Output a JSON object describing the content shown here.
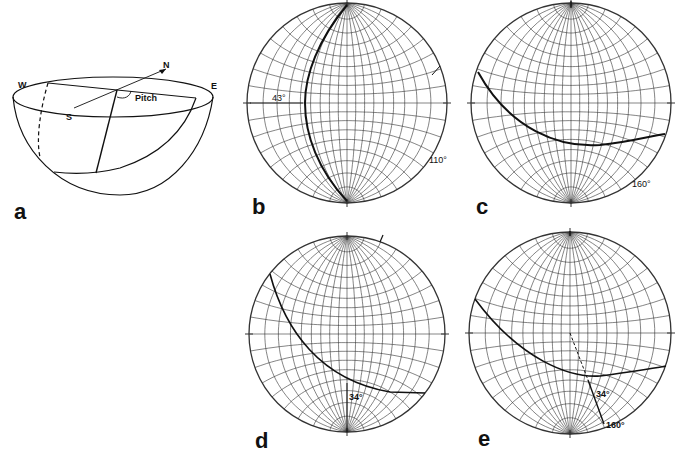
{
  "figure": {
    "panels": [
      {
        "id": "a",
        "label": "a",
        "type": "hemisphere-block",
        "compass": {
          "north": "N",
          "south": "S",
          "west": "W",
          "east": "E"
        },
        "angle_label": "Pitch"
      },
      {
        "id": "b",
        "label": "b",
        "type": "wulff-net",
        "dip_label": "43°",
        "strike_label": "110°"
      },
      {
        "id": "c",
        "label": "c",
        "type": "wulff-net",
        "strike_label": "160°"
      },
      {
        "id": "d",
        "label": "d",
        "type": "wulff-net",
        "pitch_label": "34°"
      },
      {
        "id": "e",
        "label": "e",
        "type": "wulff-net",
        "pitch_label": "34°",
        "strike_label": "160°"
      }
    ]
  },
  "colors": {
    "ink": "#111111",
    "grid": "#333333",
    "background": "#ffffff"
  }
}
